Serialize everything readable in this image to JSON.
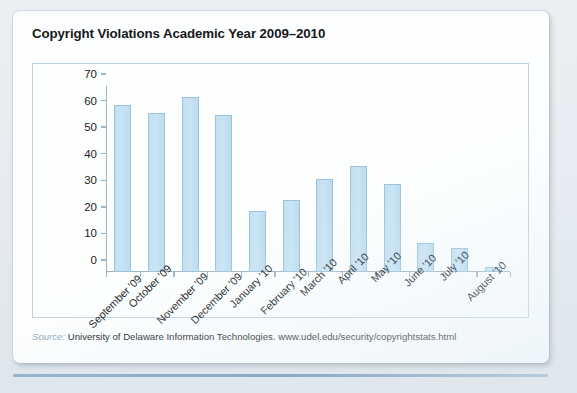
{
  "figure": {
    "title": "Copyright Violations Academic Year 2009–2010",
    "source_label": "Source:",
    "source_text": "University of Delaware Information Technologies. www.udel.edu/security/copyrightstats.html"
  },
  "colors": {
    "bar_fill": "#c6e2f3",
    "bar_border": "#9dc2da",
    "axis": "#9fb4c2",
    "plot_border": "#bcd4e2",
    "card_background": "#fdfeff",
    "page_background": "#e9eef2",
    "rule": "#8ba8c4",
    "source_label_color": "#8fa9bd"
  },
  "chart_data": {
    "type": "bar",
    "title": "Copyright Violations Academic Year 2009–2010",
    "xlabel": "",
    "ylabel": "",
    "categories": [
      "September '09",
      "October '09",
      "November '09",
      "December '09",
      "January '10",
      "February '10",
      "March '10",
      "April '10",
      "May '10",
      "June '10",
      "July '10",
      "August '10"
    ],
    "values": [
      63,
      60,
      66,
      59,
      23,
      27,
      35,
      40,
      33,
      11,
      9,
      2
    ],
    "ylim": [
      0,
      70
    ],
    "yticks": [
      0,
      10,
      20,
      30,
      40,
      50,
      60,
      70
    ],
    "ytick_labels": [
      "0",
      "10",
      "20",
      "30",
      "40",
      "50",
      "60",
      "70"
    ],
    "grid": false,
    "legend": false
  }
}
